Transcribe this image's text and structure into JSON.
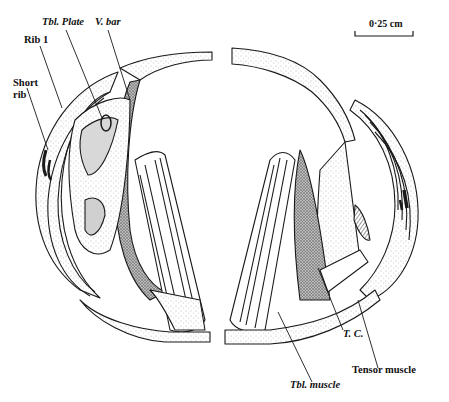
{
  "figure": {
    "type": "anatomical line drawing",
    "views": [
      "left-half",
      "right-half"
    ]
  },
  "scale_bar": {
    "label": "0·25 cm"
  },
  "labels": {
    "tbl_plate": "Tbl. Plate",
    "v_bar": "V. bar",
    "rib_1": "Rib 1",
    "short_rib_line1": "Short",
    "short_rib_line2": "rib",
    "tc": "T. C.",
    "tensor_muscle": "Tensor muscle",
    "tbl_muscle": "Tbl. muscle"
  },
  "colors": {
    "ink": "#1a1a1a",
    "stipple": "#9a9a9a",
    "dark_fill": "#6e6e6e",
    "paper": "#ffffff"
  }
}
